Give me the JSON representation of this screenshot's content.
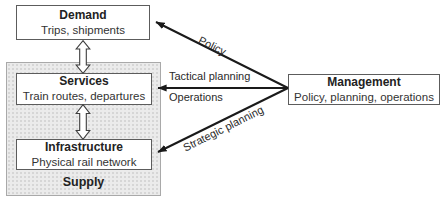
{
  "diagram": {
    "nodes": {
      "demand": {
        "title": "Demand",
        "subtitle": "Trips, shipments"
      },
      "services": {
        "title": "Services",
        "subtitle": "Train routes, departures"
      },
      "infrastructure": {
        "title": "Infrastructure",
        "subtitle": "Physical rail network"
      },
      "management": {
        "title": "Management",
        "subtitle": "Policy, planning, operations"
      }
    },
    "groups": {
      "supply": {
        "label": "Supply"
      }
    },
    "edges": {
      "policy": {
        "label": "Policy",
        "from": "management",
        "to": "demand"
      },
      "tactical": {
        "label": "Tactical planning",
        "from": "management",
        "to": "services"
      },
      "operations": {
        "label": "Operations",
        "from": "management",
        "to": "services"
      },
      "strategic": {
        "label": "Strategic planning",
        "from": "management",
        "to": "infrastructure"
      }
    },
    "colors": {
      "box_border": "#5c5c5c",
      "group_fill": "#ebebeb",
      "group_border": "#a9a9a9",
      "arrow": "#1a1a1a",
      "text": "#222222",
      "background": "#ffffff"
    }
  }
}
